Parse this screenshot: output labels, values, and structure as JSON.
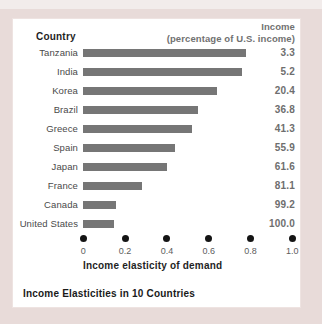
{
  "background": {
    "outer_color": "#e8dbd9",
    "top_strip_color": "#f2eceb",
    "panel_color": "#ffffff"
  },
  "header": {
    "country": "Country",
    "income_line1": "Income",
    "income_line2": "(percentage of U.S. income)"
  },
  "caption": "Income Elasticities in 10 Countries",
  "chart_data": {
    "type": "bar",
    "orientation": "horizontal",
    "title": "Income Elasticities in 10 Countries",
    "xlabel": "Income elasticity of demand",
    "xlim": [
      0,
      1.0
    ],
    "x_tick_labels": [
      "0",
      "0.2",
      "0.4",
      "0.6",
      "0.8",
      "1.0"
    ],
    "grid": false,
    "legend_position": "none",
    "bar_color": "#767676",
    "categories": [
      "Tanzania",
      "India",
      "Korea",
      "Brazil",
      "Greece",
      "Spain",
      "Japan",
      "France",
      "Canada",
      "United States"
    ],
    "series": [
      {
        "name": "Income elasticity of demand",
        "values": [
          0.78,
          0.76,
          0.64,
          0.55,
          0.52,
          0.44,
          0.4,
          0.28,
          0.16,
          0.15
        ]
      },
      {
        "name": "Income (percentage of U.S. income)",
        "values": [
          3.3,
          5.2,
          20.4,
          36.8,
          41.3,
          55.9,
          61.6,
          81.1,
          99.2,
          100.0
        ]
      }
    ],
    "value_labels_displayed": [
      "3.3",
      "5.2",
      "20.4",
      "36.8",
      "41.3",
      "55.9",
      "61.6",
      "81.1",
      "99.2",
      "100.0"
    ]
  }
}
